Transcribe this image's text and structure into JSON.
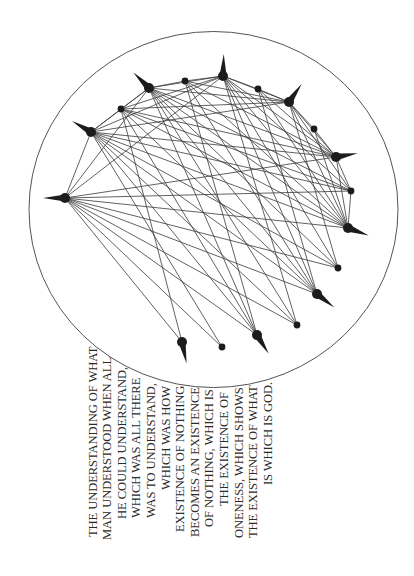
{
  "figure": {
    "circle": {
      "cx": 213.5,
      "cy": 209.5,
      "rx": 184.5,
      "ry": 178,
      "stroke": "#555555"
    },
    "edge_color": "#3a3a3a",
    "node_color": "#1c1c1c",
    "nodes": [
      {
        "x": 65,
        "y": 198,
        "size": "big",
        "spike_angle": 180
      },
      {
        "x": 91,
        "y": 132,
        "size": "big",
        "spike_angle": 210
      },
      {
        "x": 121,
        "y": 109,
        "size": "small"
      },
      {
        "x": 149,
        "y": 88,
        "size": "big",
        "spike_angle": 225
      },
      {
        "x": 185,
        "y": 81,
        "size": "small"
      },
      {
        "x": 223,
        "y": 76,
        "size": "big",
        "spike_angle": 272
      },
      {
        "x": 258,
        "y": 89,
        "size": "small"
      },
      {
        "x": 289,
        "y": 102,
        "size": "big",
        "spike_angle": 305
      },
      {
        "x": 314,
        "y": 129,
        "size": "small"
      },
      {
        "x": 336,
        "y": 157,
        "size": "big",
        "spike_angle": 350
      },
      {
        "x": 351,
        "y": 191,
        "size": "small"
      },
      {
        "x": 348,
        "y": 228,
        "size": "big",
        "spike_angle": 20
      },
      {
        "x": 338,
        "y": 268,
        "size": "small"
      },
      {
        "x": 317,
        "y": 294,
        "size": "big",
        "spike_angle": 38
      },
      {
        "x": 297,
        "y": 325,
        "size": "small"
      },
      {
        "x": 257,
        "y": 335,
        "size": "big",
        "spike_angle": 58
      },
      {
        "x": 222,
        "y": 347,
        "size": "small"
      },
      {
        "x": 182,
        "y": 342,
        "size": "big",
        "spike_angle": 78
      }
    ],
    "edges": [
      [
        0,
        1
      ],
      [
        1,
        2
      ],
      [
        2,
        3
      ],
      [
        3,
        4
      ],
      [
        4,
        5
      ],
      [
        5,
        6
      ],
      [
        6,
        7
      ],
      [
        7,
        8
      ],
      [
        8,
        9
      ],
      [
        9,
        10
      ],
      [
        0,
        3
      ],
      [
        0,
        5
      ],
      [
        1,
        3
      ],
      [
        1,
        5
      ],
      [
        1,
        7
      ],
      [
        2,
        5
      ],
      [
        2,
        7
      ],
      [
        3,
        5
      ],
      [
        3,
        7
      ],
      [
        3,
        9
      ],
      [
        5,
        7
      ],
      [
        4,
        7
      ],
      [
        0,
        9
      ],
      [
        0,
        10
      ],
      [
        0,
        11
      ],
      [
        0,
        12
      ],
      [
        0,
        13
      ],
      [
        0,
        14
      ],
      [
        0,
        15
      ],
      [
        0,
        16
      ],
      [
        0,
        17
      ],
      [
        1,
        9
      ],
      [
        1,
        10
      ],
      [
        1,
        11
      ],
      [
        1,
        12
      ],
      [
        1,
        13
      ],
      [
        1,
        14
      ],
      [
        1,
        15
      ],
      [
        1,
        16
      ],
      [
        2,
        9
      ],
      [
        2,
        10
      ],
      [
        2,
        11
      ],
      [
        2,
        13
      ],
      [
        2,
        15
      ],
      [
        2,
        17
      ],
      [
        3,
        10
      ],
      [
        3,
        11
      ],
      [
        3,
        12
      ],
      [
        3,
        13
      ],
      [
        3,
        14
      ],
      [
        3,
        15
      ],
      [
        4,
        9
      ],
      [
        4,
        11
      ],
      [
        4,
        13
      ],
      [
        4,
        15
      ],
      [
        5,
        9
      ],
      [
        5,
        10
      ],
      [
        5,
        11
      ],
      [
        5,
        12
      ],
      [
        5,
        13
      ],
      [
        5,
        14
      ],
      [
        6,
        9
      ],
      [
        6,
        11
      ],
      [
        6,
        13
      ],
      [
        7,
        9
      ],
      [
        7,
        10
      ],
      [
        7,
        11
      ],
      [
        7,
        12
      ],
      [
        8,
        11
      ],
      [
        9,
        11
      ],
      [
        10,
        11
      ]
    ]
  },
  "caption": {
    "lines": [
      {
        "text": "THE UNDERSTANDING OF WHAT",
        "x": 93,
        "y_start": 537
      },
      {
        "text": "MAN UNDERSTOOD WHEN ALL",
        "x": 107.6,
        "y_start": 540
      },
      {
        "text": "HE COULD UNDERSTAND,",
        "x": 122.2,
        "y_start": 519
      },
      {
        "text": "WHICH WAS ALL THERE",
        "x": 136.8,
        "y_start": 518
      },
      {
        "text": "WAS TO UNDERSTAND,",
        "x": 151.4,
        "y_start": 518
      },
      {
        "text": "WHICH WAS HOW",
        "x": 166,
        "y_start": 490
      },
      {
        "text": "EXISTENCE OF NOTHING",
        "x": 180.6,
        "y_start": 532
      },
      {
        "text": "BECOMES AN EXISTENCE",
        "x": 195.2,
        "y_start": 537
      },
      {
        "text": "OF NOTHING, WHICH IS",
        "x": 209.8,
        "y_start": 527
      },
      {
        "text": "THE EXISTENCE OF",
        "x": 224.4,
        "y_start": 506
      },
      {
        "text": "ONENESS, WHICH SHOWS",
        "x": 239,
        "y_start": 538
      },
      {
        "text": "THE EXISTENCE OF WHAT",
        "x": 253.6,
        "y_start": 538
      },
      {
        "text": "IS WHICH IS GOD.",
        "x": 268.2,
        "y_start": 485
      }
    ]
  }
}
